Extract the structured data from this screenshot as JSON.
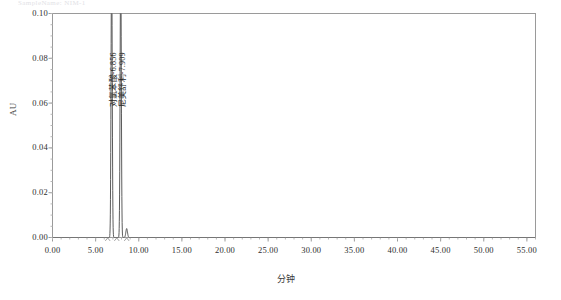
{
  "header": {
    "faint_text": "SampleName:   NIM-1"
  },
  "chart_data": {
    "type": "line",
    "title": "",
    "xlabel": "分钟",
    "ylabel": "AU",
    "xlim": [
      0.0,
      56.0
    ],
    "ylim": [
      0.0,
      0.1
    ],
    "grid": false,
    "legend": "none",
    "x_ticks": [
      "0.00",
      "5.00",
      "10.00",
      "15.00",
      "20.00",
      "25.00",
      "30.00",
      "35.00",
      "40.00",
      "45.00",
      "50.00",
      "55.00"
    ],
    "x_tick_values": [
      0,
      5,
      10,
      15,
      20,
      25,
      30,
      35,
      40,
      45,
      50,
      55
    ],
    "y_ticks": [
      "0.00",
      "0.02",
      "0.04",
      "0.06",
      "0.08",
      "0.10"
    ],
    "y_tick_values": [
      0.0,
      0.02,
      0.04,
      0.06,
      0.08,
      0.1
    ],
    "series": [
      {
        "name": "chromatogram",
        "color": "#4a4a4a",
        "baseline": 0.0,
        "peaks": [
          {
            "label": "对氯苯酸-6.856",
            "rt": 6.856,
            "height": 0.125,
            "width": 0.16,
            "off_scale": true
          },
          {
            "label": "尼美舒利-7.909",
            "rt": 7.909,
            "height": 0.125,
            "width": 0.16,
            "off_scale": true
          },
          {
            "label": "",
            "rt": 8.6,
            "height": 0.004,
            "width": 0.22,
            "off_scale": false
          }
        ]
      }
    ],
    "baseline_markers": [
      {
        "rt": 6.4
      },
      {
        "rt": 7.45
      },
      {
        "rt": 8.6
      }
    ],
    "annotations": [
      {
        "text": "对氯苯酸-6.856",
        "rt": 6.856,
        "orientation": "vertical"
      },
      {
        "text": "尼美舒利-7.909",
        "rt": 7.909,
        "orientation": "vertical"
      }
    ]
  },
  "axis_colors": {
    "frame": "#9a9a9a",
    "trace": "#4a4a4a",
    "text": "#2e2e2e"
  }
}
